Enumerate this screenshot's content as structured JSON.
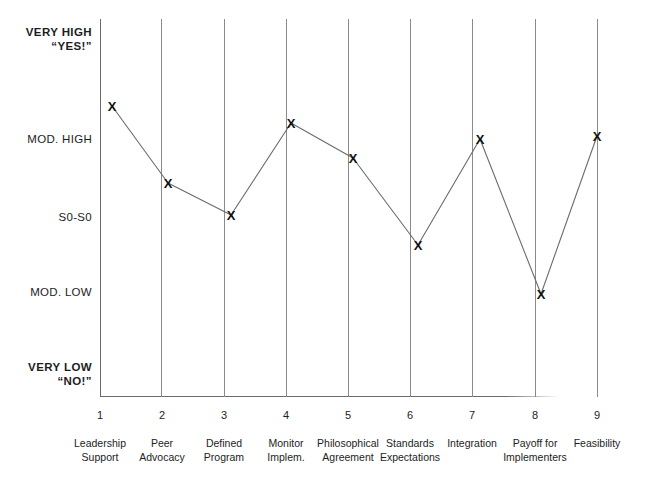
{
  "chart_data": {
    "type": "line",
    "title": "",
    "subtitle": "",
    "xlabel": "",
    "ylabel": "",
    "grid": "vertical gridlines at each category",
    "legend": "none",
    "marker": "X",
    "x": [
      1,
      2,
      3,
      4,
      5,
      6,
      7,
      8,
      9
    ],
    "x_tick_labels": [
      "1",
      "2",
      "3",
      "4",
      "5",
      "6",
      "7",
      "8",
      "9"
    ],
    "categories": [
      "Leadership Support",
      "Peer Advocacy",
      "Defined Program",
      "Monitor Implem.",
      "Philosophical Agreement",
      "Standards Expectations",
      "Integration",
      "Payoff for Implementers",
      "Feasibility"
    ],
    "category_lines": [
      [
        "Leadership",
        "Support"
      ],
      [
        "Peer",
        "Advocacy"
      ],
      [
        "Defined",
        "Program"
      ],
      [
        "Monitor",
        "Implem."
      ],
      [
        "Philosophical",
        "Agreement"
      ],
      [
        "Standards",
        "Expectations"
      ],
      [
        "Integration",
        ""
      ],
      [
        "Payoff for",
        "Implementers"
      ],
      [
        "Feasibility",
        ""
      ]
    ],
    "y_tick_labels": [
      "VERY HIGH \"YES!\"",
      "MOD. HIGH",
      "S0-S0",
      "MOD. LOW",
      "VERY LOW \"NO!\""
    ],
    "ylim": [
      1,
      5
    ],
    "yticks": [
      5,
      4,
      3,
      2,
      1
    ],
    "values": [
      4.22,
      3.45,
      3.07,
      4.06,
      3.74,
      2.75,
      3.95,
      2.07,
      3.98
    ],
    "value_labels": [
      "Between MOD. HIGH and VERY HIGH",
      "Between S0-S0 and MOD. HIGH",
      "S0-S0",
      "Slightly above MOD. HIGH",
      "Just below MOD. HIGH",
      "Between MOD. LOW and S0-S0",
      "MOD. HIGH",
      "MOD. LOW",
      "MOD. HIGH"
    ],
    "pixel_points": [
      {
        "x": 112,
        "y": 106
      },
      {
        "x": 168,
        "y": 183
      },
      {
        "x": 231,
        "y": 215
      },
      {
        "x": 291,
        "y": 123
      },
      {
        "x": 353,
        "y": 158
      },
      {
        "x": 418,
        "y": 245
      },
      {
        "x": 480,
        "y": 139
      },
      {
        "x": 541,
        "y": 294
      },
      {
        "x": 597,
        "y": 136
      }
    ],
    "colors": {
      "line": "#6b6b6b",
      "marker": "#111111",
      "axis": "#6b6b6b",
      "gridline": "#8a8a8a",
      "background": "#ffffff",
      "text": "#1d1d1d"
    }
  },
  "y_axis": {
    "labels": [
      {
        "line1": "VERY HIGH",
        "line2": "“YES!”",
        "bold": true,
        "top": 26
      },
      {
        "line1": "MOD. HIGH",
        "line2": "",
        "bold": false,
        "top": 133
      },
      {
        "line1": "S0-S0",
        "line2": "",
        "bold": false,
        "top": 211
      },
      {
        "line1": "MOD. LOW",
        "line2": "",
        "bold": false,
        "top": 286
      },
      {
        "line1": "VERY LOW",
        "line2": "“NO!”",
        "bold": true,
        "top": 361
      }
    ]
  },
  "x_axis": {
    "ticks": [
      {
        "num": "1",
        "left": 100,
        "line1": "Leadership",
        "line2": "Support"
      },
      {
        "num": "2",
        "left": 162,
        "line1": "Peer",
        "line2": "Advocacy"
      },
      {
        "num": "3",
        "left": 224,
        "line1": "Defined",
        "line2": "Program"
      },
      {
        "num": "4",
        "left": 286,
        "line1": "Monitor",
        "line2": "Implem."
      },
      {
        "num": "5",
        "left": 348,
        "line1": "Philosophical",
        "line2": "Agreement"
      },
      {
        "num": "6",
        "left": 410,
        "line1": "Standards",
        "line2": "Expectations"
      },
      {
        "num": "7",
        "left": 472,
        "line1": "Integration",
        "line2": ""
      },
      {
        "num": "8",
        "left": 535,
        "line1": "Payoff for",
        "line2": "Implementers"
      },
      {
        "num": "9",
        "left": 597,
        "line1": "Feasibility",
        "line2": ""
      }
    ]
  },
  "plot": {
    "gridlines_x": [
      161,
      224,
      286,
      348,
      410,
      472,
      535,
      597
    ],
    "marker_glyph": "X"
  }
}
